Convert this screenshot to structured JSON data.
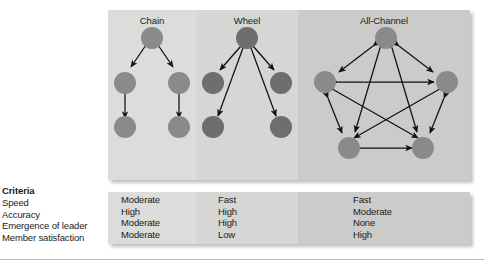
{
  "figure": {
    "criteria_heading": "Criteria",
    "criteria": [
      "Speed",
      "Accuracy",
      "Emergence of leader",
      "Member satisfaction"
    ],
    "networks": [
      {
        "name": "Chain",
        "title": "Chain",
        "node_count": 5,
        "node_color": "#8a8a8a",
        "panel_color": "#dcdcda",
        "values": [
          "Moderate",
          "High",
          "Moderate",
          "Moderate"
        ]
      },
      {
        "name": "Wheel",
        "title": "Wheel",
        "node_count": 5,
        "node_color": "#6e6e6e",
        "panel_color": "#d6d6d4",
        "values": [
          "Fast",
          "High",
          "High",
          "Low"
        ]
      },
      {
        "name": "All-Channel",
        "title": "All-Channel",
        "node_count": 5,
        "node_color": "#8a8a8a",
        "panel_color": "#cbcbc9",
        "values": [
          "Fast",
          "Moderate",
          "None",
          "High"
        ]
      }
    ],
    "table_rows": [
      {
        "criterion": "Speed",
        "chain": "Moderate",
        "wheel": "Fast",
        "all_channel": "Fast"
      },
      {
        "criterion": "Accuracy",
        "chain": "High",
        "wheel": "High",
        "all_channel": "Moderate"
      },
      {
        "criterion": "Emergence of leader",
        "chain": "Moderate",
        "wheel": "High",
        "all_channel": "None"
      },
      {
        "criterion": "Member satisfaction",
        "chain": "Moderate",
        "wheel": "Low",
        "all_channel": "High"
      }
    ]
  }
}
